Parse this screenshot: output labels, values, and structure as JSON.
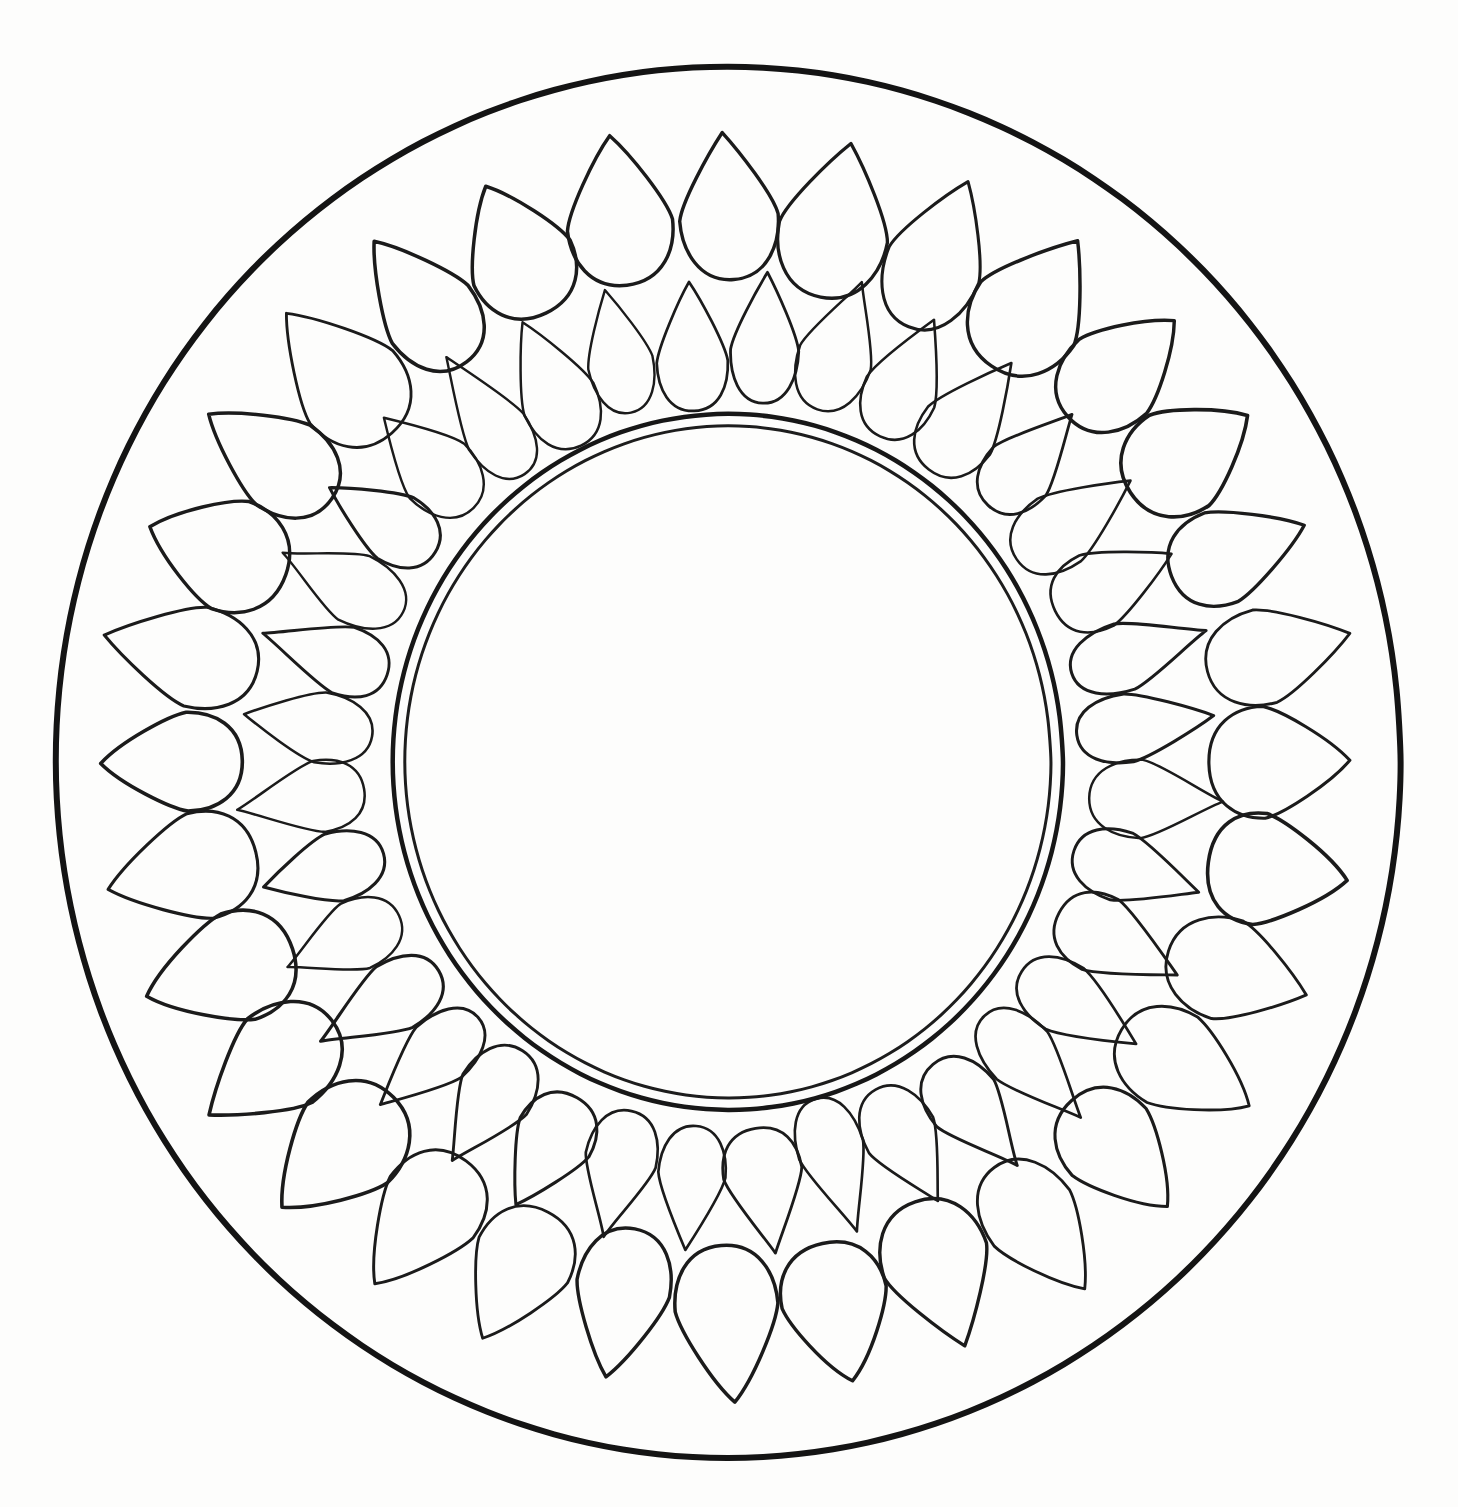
{
  "artwork": {
    "title": "Concentric Petal Ring Mandala Line Drawing",
    "description": "Hand-drawn black ink outline of a circular mandala: a bold outer circle enclosing two concentric rings of teardrop (egg / petal) shapes, surrounding a plain double-line center circle.",
    "medium": "ink line drawing",
    "background_color": "#fdfdfc",
    "ink_color": "#111111"
  },
  "canvas": {
    "width": 1458,
    "height": 1507,
    "center_x": 728,
    "center_y": 762
  },
  "outer_boundary": {
    "name": "outer-boundary-circle",
    "radius_x": 672,
    "radius_y": 696,
    "stroke_width": 6,
    "color": "#141414"
  },
  "center_medallion": {
    "name": "center-medallion",
    "outer_circle": {
      "radius_x": 335,
      "radius_y": 348,
      "stroke_width": 4.5,
      "color": "#171717"
    },
    "inner_circle": {
      "radius_x": 323,
      "radius_y": 336,
      "stroke_width": 3,
      "color": "#1d1d1d"
    }
  },
  "petal_rings": [
    {
      "name": "outer-petal-ring",
      "count": 32,
      "ring_radius": 556,
      "petal_length": 150,
      "petal_width": 104,
      "orientation": "narrow-end-inward",
      "stroke_width": 3.2,
      "color": "#1b1b1b",
      "start_angle_deg": -90
    },
    {
      "name": "inner-petal-ring",
      "count": 36,
      "ring_radius": 424,
      "petal_length": 132,
      "petal_width": 72,
      "orientation": "narrow-end-inward",
      "stroke_width": 2.8,
      "color": "#1b1b1b",
      "start_angle_deg": -85
    }
  ],
  "chart_data": {
    "type": "pie",
    "categories": [
      "outer-petal-ring",
      "inner-petal-ring"
    ],
    "values": [
      32,
      36
    ],
    "xlabel": "",
    "ylabel": "petal count",
    "legend_position": "none",
    "grid": false
  }
}
